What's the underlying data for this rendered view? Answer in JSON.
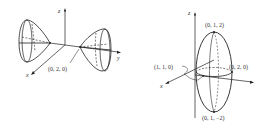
{
  "figures": [
    {
      "id": "left",
      "description": "Hyperboloid of two sheets opening along the y-axis",
      "axes": {
        "x": "x",
        "y": "y",
        "z": "z"
      },
      "points": [
        {
          "label": "(0, 2, 0)"
        }
      ]
    },
    {
      "id": "right",
      "description": "Ellipsoid centered at (0,1,0) elongated along z",
      "axes": {
        "x": "x",
        "y": "y",
        "z": "z"
      },
      "points": [
        {
          "label": "(0, 1, 2)"
        },
        {
          "label": "(1, 1, 0)"
        },
        {
          "label": "(0, 2, 0)"
        },
        {
          "label": "(0, 1, −2)"
        }
      ]
    }
  ],
  "colors": {
    "line": "#222222",
    "text": "#333333",
    "background": "#ffffff"
  }
}
